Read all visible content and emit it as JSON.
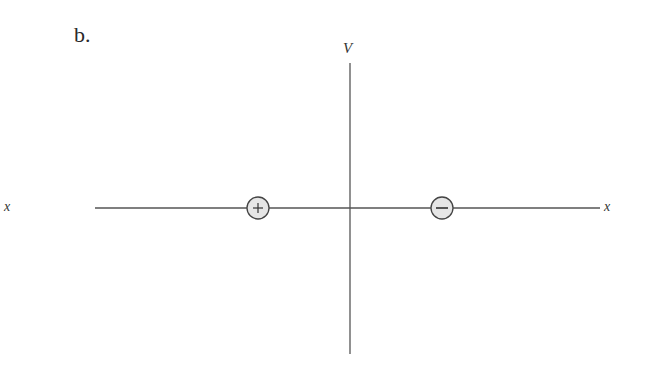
{
  "figure": {
    "panel_label": "b.",
    "vertical_axis": {
      "label": "V",
      "x": 350,
      "y_top": 63,
      "y_bottom": 354
    },
    "horizontal_axis": {
      "label_left": "x",
      "label_right": "x",
      "y": 208,
      "x_left": 95,
      "x_right": 600
    },
    "charges": [
      {
        "sign": "+",
        "name": "positive-charge",
        "cx": 258,
        "cy": 208,
        "r": 11
      },
      {
        "sign": "−",
        "name": "negative-charge",
        "cx": 442,
        "cy": 208,
        "r": 11
      }
    ],
    "colors": {
      "line": "#555555",
      "charge_fill": "#e6e6e6",
      "charge_stroke": "#444444",
      "text": "#333333"
    }
  }
}
